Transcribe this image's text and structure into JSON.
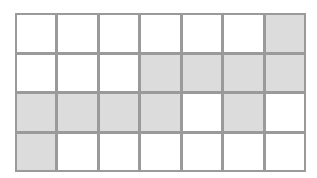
{
  "grid": {
    "rows": 4,
    "cols": 7,
    "colors": {
      "border": "#9a9a9a",
      "shaded": "#dcdcdc",
      "empty": "#ffffff"
    },
    "cells": [
      [
        0,
        0,
        0,
        0,
        0,
        0,
        1
      ],
      [
        0,
        0,
        0,
        1,
        1,
        1,
        1
      ],
      [
        1,
        1,
        1,
        1,
        0,
        1,
        0
      ],
      [
        1,
        0,
        0,
        0,
        0,
        0,
        0
      ]
    ],
    "shaded_count": 11,
    "total_cells": 28
  }
}
